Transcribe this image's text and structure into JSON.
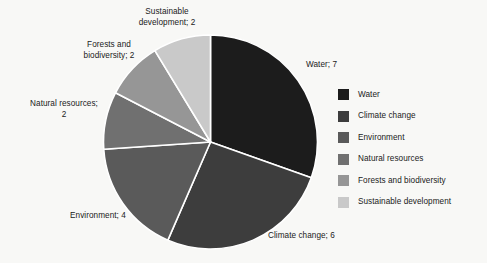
{
  "background_color": "#f8f8f6",
  "chart_data": {
    "type": "pie",
    "title": "",
    "total": 23,
    "start_angle_deg": 0,
    "direction": "clockwise",
    "separator_color": "#ffffff",
    "categories": [
      "Water",
      "Climate change",
      "Environment",
      "Natural resources",
      "Forests and biodiversity",
      "Sustainable development"
    ],
    "values": [
      7,
      6,
      4,
      2,
      2,
      2
    ],
    "colors": [
      "#1c1c1c",
      "#3d3d3d",
      "#5a5a5a",
      "#707070",
      "#969696",
      "#c9c9c9"
    ],
    "legend_position": "right",
    "grid": false,
    "slices": [
      {
        "label": "Water",
        "value": 7,
        "color": "#1c1c1c",
        "callout": "Water; 7"
      },
      {
        "label": "Climate change",
        "value": 6,
        "color": "#3d3d3d",
        "callout": "Climate change; 6"
      },
      {
        "label": "Environment",
        "value": 4,
        "color": "#5a5a5a",
        "callout": "Environment; 4"
      },
      {
        "label": "Natural resources",
        "value": 2,
        "color": "#707070",
        "callout": "Natural resources;\n2"
      },
      {
        "label": "Forests and biodiversity",
        "value": 2,
        "color": "#969696",
        "callout": "Forests and\nbiodiversity; 2"
      },
      {
        "label": "Sustainable development",
        "value": 2,
        "color": "#c9c9c9",
        "callout": "Sustainable\ndevelopment; 2"
      }
    ]
  },
  "callouts": {
    "water": "Water; 7",
    "climate_change": "Climate change; 6",
    "environment": "Environment; 4",
    "natural_resources": "Natural resources;\n2",
    "forests_biodiversity": "Forests and\nbiodiversity; 2",
    "sustainable_development": "Sustainable\ndevelopment; 2"
  },
  "legend": {
    "items": [
      {
        "label": "Water",
        "color": "#1c1c1c"
      },
      {
        "label": "Climate change",
        "color": "#3d3d3d"
      },
      {
        "label": "Environment",
        "color": "#5a5a5a"
      },
      {
        "label": "Natural resources",
        "color": "#707070"
      },
      {
        "label": "Forests and biodiversity",
        "color": "#969696"
      },
      {
        "label": "Sustainable development",
        "color": "#c9c9c9"
      }
    ]
  }
}
